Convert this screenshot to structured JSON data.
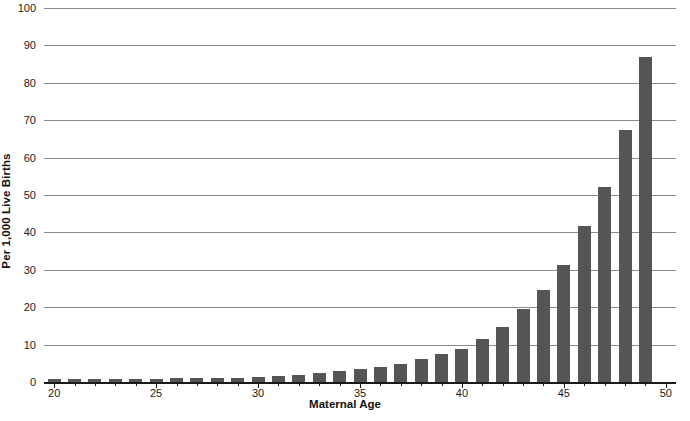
{
  "chart_data": {
    "type": "bar",
    "title": "",
    "xlabel": "Maternal Age",
    "ylabel": "Per 1,000 Live Births",
    "xlim": [
      19.5,
      50.5
    ],
    "ylim": [
      0,
      100
    ],
    "grid": true,
    "legend": null,
    "bar_color": "#555555",
    "gridline_color": "#8a8a8a",
    "axis_color": "#1a1a1a",
    "x_tick_labels": [
      "20",
      "25",
      "30",
      "35",
      "40",
      "45",
      "50"
    ],
    "x_tick_values": [
      20,
      25,
      30,
      35,
      40,
      45,
      50
    ],
    "y_tick_labels": [
      "0",
      "10",
      "20",
      "30",
      "40",
      "50",
      "60",
      "70",
      "80",
      "90",
      "100"
    ],
    "y_tick_values": [
      0,
      10,
      20,
      30,
      40,
      50,
      60,
      70,
      80,
      90,
      100
    ],
    "categories": [
      20,
      21,
      22,
      23,
      24,
      25,
      26,
      27,
      28,
      29,
      30,
      31,
      32,
      33,
      34,
      35,
      36,
      37,
      38,
      39,
      40,
      41,
      42,
      43,
      44,
      45,
      46,
      47,
      48,
      49,
      50
    ],
    "values": [
      0.7,
      0.7,
      0.8,
      0.8,
      0.9,
      0.9,
      1.0,
      1.0,
      1.1,
      1.2,
      1.3,
      1.5,
      1.8,
      2.3,
      2.9,
      3.4,
      4.1,
      4.8,
      6.1,
      7.5,
      8.7,
      11.4,
      14.8,
      19.4,
      24.5,
      31.4,
      41.6,
      52.2,
      67.3,
      87.0,
      0.0
    ]
  },
  "caption": "",
  "axis_titles": {
    "x": "Maternal Age",
    "y": "Per 1,000 Live Births"
  }
}
